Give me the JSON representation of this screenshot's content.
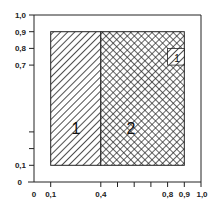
{
  "diagram": {
    "type": "region-partition",
    "x_axis": {
      "range": [
        0,
        1.0
      ],
      "tick_labels": [
        "0",
        "0,1",
        "0,4",
        "0,8",
        "0,9",
        "1,0"
      ],
      "tick_values": [
        0,
        0.1,
        0.4,
        0.5,
        0.6,
        0.7,
        0.8,
        0.9,
        1.0
      ]
    },
    "y_axis": {
      "range": [
        0,
        1.0
      ],
      "tick_labels": [
        "0",
        "0,1",
        "0,7",
        "0,8",
        "0,9",
        "1,0"
      ],
      "tick_values": [
        0,
        0.1,
        0.2,
        0.3,
        0.7,
        0.8,
        0.9,
        1.0
      ]
    },
    "regions": [
      {
        "label": "1",
        "pattern": "diagonal-hatch",
        "x": [
          0.1,
          0.4
        ],
        "y": [
          0.1,
          0.9
        ]
      },
      {
        "label": "2",
        "pattern": "cross-hatch",
        "x": [
          0.4,
          0.9
        ],
        "y": [
          0.1,
          0.9
        ]
      },
      {
        "label": "1",
        "pattern": "diagonal-hatch",
        "x": [
          0.8,
          0.9
        ],
        "y": [
          0.7,
          0.8
        ]
      }
    ]
  },
  "labels": {
    "x0": "0",
    "x01": "0,1",
    "x04": "0,4",
    "x08": "0,8",
    "x09": "0,9",
    "x10": "1,0",
    "y0": "0",
    "y01": "0,1",
    "y07": "0,7",
    "y08": "0,8",
    "y09": "0,9",
    "y10": "1,0",
    "region1": "1",
    "region2": "2",
    "small_region": "1"
  },
  "colors": {
    "ink": "#222222",
    "background": "#ffffff"
  }
}
